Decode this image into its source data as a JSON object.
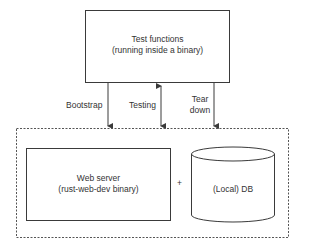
{
  "diagram": {
    "top_box": {
      "line1": "Test functions",
      "line2": "(running inside a binary)"
    },
    "arrows": {
      "bootstrap": "Bootstrap",
      "testing": "Testing",
      "teardown_line1": "Tear",
      "teardown_line2": "down"
    },
    "environment": {
      "web_server_line1": "Web server",
      "web_server_line2": "(rust-web-dev binary)",
      "plus": "+",
      "db": "(Local) DB"
    }
  },
  "colors": {
    "stroke": "#3a3a3a",
    "dashed": "#555555",
    "background": "#ffffff"
  }
}
